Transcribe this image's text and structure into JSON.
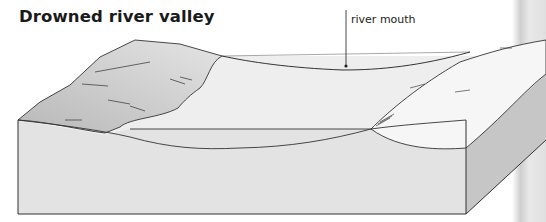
{
  "title": "Drowned river valley",
  "annotations": [
    {
      "label": "river mouth",
      "target": "water-surface"
    }
  ],
  "colors": {
    "line": "#333333",
    "block_front": "#e2e2e2",
    "block_side": "#c4c4c4",
    "left_valley_side": "#c8c8c8",
    "right_valley_side": "#f4f4f4",
    "water": "#ececec",
    "page_gutter": "#d6d6d6"
  }
}
